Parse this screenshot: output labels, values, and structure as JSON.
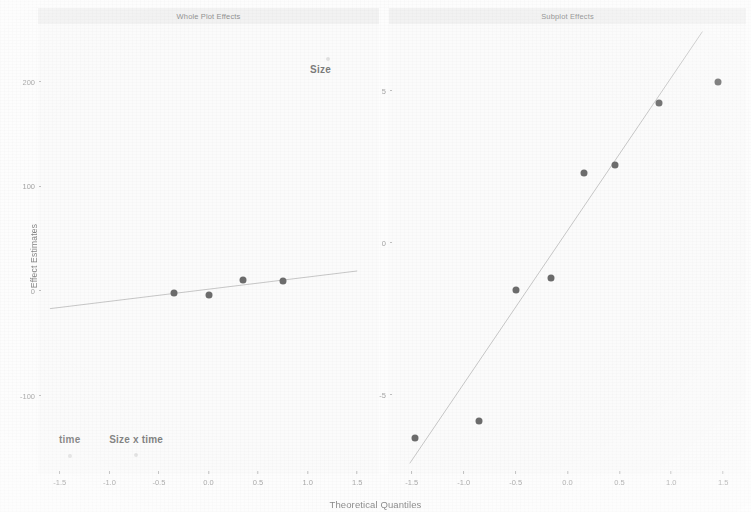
{
  "axes": {
    "ylabel": "Effect Estimates",
    "xlabel": "Theoretical Quantiles",
    "xticks": [
      "-1.5",
      "-1.0",
      "-0.5",
      "0.0",
      "0.5",
      "1.0",
      "1.5"
    ],
    "xtick_values": [
      -1.5,
      -1.0,
      -0.5,
      0.0,
      0.5,
      1.0,
      1.5
    ],
    "xlim": [
      -1.72,
      1.72
    ]
  },
  "panels": {
    "left": {
      "title": "Whole Plot Effects",
      "yticks": [
        "200",
        "100",
        "0",
        "-100"
      ],
      "ytick_values": [
        200,
        100,
        0,
        -100
      ],
      "ylim": [
        -175,
        255
      ]
    },
    "right": {
      "title": "Subplot Effects",
      "yticks": [
        "5",
        "0",
        "-5"
      ],
      "ytick_values": [
        5,
        0,
        -5
      ],
      "ylim": [
        -7.6,
        7.2
      ]
    }
  },
  "annotations": {
    "left": [
      {
        "text": "Size",
        "x": 1.13,
        "y": 212
      },
      {
        "text": "time",
        "x": -1.4,
        "y": -142
      },
      {
        "text": "Size x time",
        "x": -0.73,
        "y": -142
      }
    ]
  },
  "chart_data": {
    "type": "scatter",
    "title": "",
    "xlabel": "Theoretical Quantiles",
    "ylabel": "Effect Estimates",
    "grid": false,
    "legend": "none",
    "panels": [
      {
        "name": "Whole Plot Effects",
        "xlim": [
          -1.72,
          1.72
        ],
        "ylim": [
          -175,
          255
        ],
        "xticks": [
          -1.5,
          -1.0,
          -0.5,
          0.0,
          0.5,
          1.0,
          1.5
        ],
        "yticks": [
          200,
          100,
          0,
          -100
        ],
        "points": [
          {
            "x": -1.4,
            "y": -158,
            "label": "time",
            "style": "ghost"
          },
          {
            "x": -0.73,
            "y": -157,
            "label": "Size x time",
            "style": "ghost"
          },
          {
            "x": -0.35,
            "y": -2,
            "label": "",
            "style": "solid"
          },
          {
            "x": 0.0,
            "y": -4,
            "label": "",
            "style": "solid"
          },
          {
            "x": 0.35,
            "y": 10,
            "label": "",
            "style": "solid"
          },
          {
            "x": 0.75,
            "y": 9,
            "label": "",
            "style": "solid"
          },
          {
            "x": 1.21,
            "y": 222,
            "label": "Size",
            "style": "ghost"
          }
        ],
        "reference_line": {
          "x1": -1.6,
          "y1": -17,
          "x2": 1.5,
          "y2": 19
        }
      },
      {
        "name": "Subplot Effects",
        "xlim": [
          -1.72,
          1.72
        ],
        "ylim": [
          -7.6,
          7.2
        ],
        "xticks": [
          -1.5,
          -1.0,
          -0.5,
          0.0,
          0.5,
          1.0,
          1.5
        ],
        "yticks": [
          5,
          0,
          -5
        ],
        "points": [
          {
            "x": -1.47,
            "y": -6.4,
            "style": "solid"
          },
          {
            "x": -0.85,
            "y": -5.85,
            "style": "solid"
          },
          {
            "x": -0.5,
            "y": -1.55,
            "style": "solid"
          },
          {
            "x": -0.16,
            "y": -1.15,
            "style": "solid"
          },
          {
            "x": 0.16,
            "y": 2.3,
            "style": "solid"
          },
          {
            "x": 0.46,
            "y": 2.55,
            "style": "solid"
          },
          {
            "x": 0.88,
            "y": 4.6,
            "style": "solid"
          },
          {
            "x": 1.45,
            "y": 5.3,
            "style": "solid"
          }
        ],
        "reference_line": {
          "x1": -1.52,
          "y1": -7.25,
          "x2": 1.3,
          "y2": 6.95
        }
      }
    ]
  }
}
